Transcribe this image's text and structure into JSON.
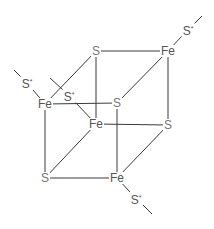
{
  "diagram": {
    "colors": {
      "bond": "#3a3a3a",
      "fe_label": "#555555",
      "s_label": "#777777",
      "background": "#ffffff"
    },
    "atoms": [
      {
        "id": "s_top",
        "label": "S",
        "x": 96,
        "y": 51
      },
      {
        "id": "fe_top",
        "label": "Fe",
        "x": 168,
        "y": 51
      },
      {
        "id": "fe_left",
        "label": "Fe",
        "x": 45,
        "y": 104
      },
      {
        "id": "s_mid",
        "label": "S",
        "x": 117,
        "y": 103
      },
      {
        "id": "fe_mid",
        "label": "Fe",
        "x": 96,
        "y": 124
      },
      {
        "id": "s_right",
        "label": "S",
        "x": 168,
        "y": 125
      },
      {
        "id": "s_bottom_left",
        "label": "S",
        "x": 45,
        "y": 178
      },
      {
        "id": "fe_bottom",
        "label": "Fe",
        "x": 117,
        "y": 178
      }
    ],
    "ligands": [
      {
        "id": "sstar_top",
        "label": "S",
        "sup": "*",
        "x": 188,
        "y": 30
      },
      {
        "id": "sstar_left",
        "label": "S",
        "sup": "*",
        "x": 27,
        "y": 83
      },
      {
        "id": "sstar_inner",
        "label": "S",
        "sup": "*",
        "x": 69,
        "y": 96
      },
      {
        "id": "sstar_bottom",
        "label": "S",
        "sup": "*",
        "x": 136,
        "y": 199
      }
    ]
  }
}
